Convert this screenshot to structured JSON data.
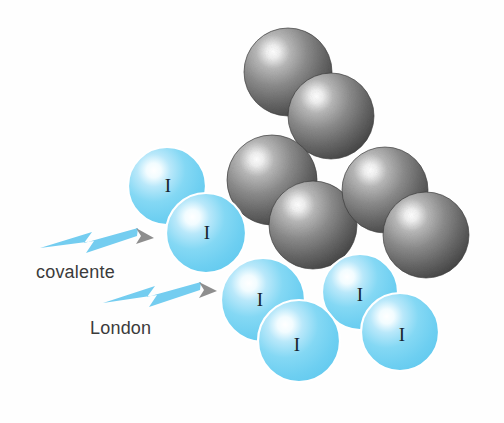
{
  "figure": {
    "background_color": "#fefefe",
    "width": 504,
    "height": 423
  },
  "colors": {
    "sphere_blue_base": "#6ecff1",
    "sphere_blue_mid": "#8fdcf6",
    "sphere_blue_highlight": "#ffffff",
    "sphere_blue_edge": "#4cbde8",
    "sphere_gray_base": "#5c5c5c",
    "sphere_gray_mid": "#8a8a8a",
    "sphere_gray_highlight": "#ffffff",
    "sphere_gray_edge": "#3a3a3a",
    "arrow_blue": "#74cdf0",
    "arrow_head_gray": "#8a8a8a",
    "text_gray": "#3b3b3b",
    "atom_label": "#16242e"
  },
  "labels": {
    "covalente": "covalente",
    "london": "London"
  },
  "atom_symbol": "I",
  "arrows": [
    {
      "name": "covalente",
      "label": "covalente",
      "points_to": "intramolecular-bond-blue-pair-top",
      "tip_x": 150,
      "tip_y": 238
    },
    {
      "name": "london",
      "label": "London",
      "points_to": "intermolecular-contact-blue-clusters",
      "tip_x": 213,
      "tip_y": 290
    }
  ],
  "spheres": {
    "blue": [
      {
        "id": "I1",
        "label": "I",
        "cx": 167,
        "cy": 186,
        "r": 39,
        "label_x": 168,
        "label_y": 185
      },
      {
        "id": "I2",
        "label": "I",
        "cx": 206,
        "cy": 233,
        "r": 40,
        "label_x": 207,
        "label_y": 232
      },
      {
        "id": "I3",
        "label": "I",
        "cx": 263,
        "cy": 300,
        "r": 42,
        "label_x": 260,
        "label_y": 299
      },
      {
        "id": "I4",
        "label": "I",
        "cx": 299,
        "cy": 341,
        "r": 41,
        "label_x": 297,
        "label_y": 344
      },
      {
        "id": "I5",
        "label": "I",
        "cx": 360,
        "cy": 292,
        "r": 38,
        "label_x": 360,
        "label_y": 294
      },
      {
        "id": "I6",
        "label": "I",
        "cx": 400,
        "cy": 332,
        "r": 39,
        "label_x": 402,
        "label_y": 334
      }
    ],
    "gray": [
      {
        "id": "G1",
        "cx": 288,
        "cy": 72,
        "r": 44
      },
      {
        "id": "G2",
        "cx": 331,
        "cy": 116,
        "r": 43
      },
      {
        "id": "G3",
        "cx": 272,
        "cy": 180,
        "r": 45
      },
      {
        "id": "G4",
        "cx": 313,
        "cy": 225,
        "r": 44
      },
      {
        "id": "G5",
        "cx": 385,
        "cy": 190,
        "r": 43
      },
      {
        "id": "G6",
        "cx": 426,
        "cy": 235,
        "r": 43
      }
    ]
  },
  "counts": {
    "blue_spheres": 6,
    "gray_spheres": 6,
    "arrows": 2
  }
}
